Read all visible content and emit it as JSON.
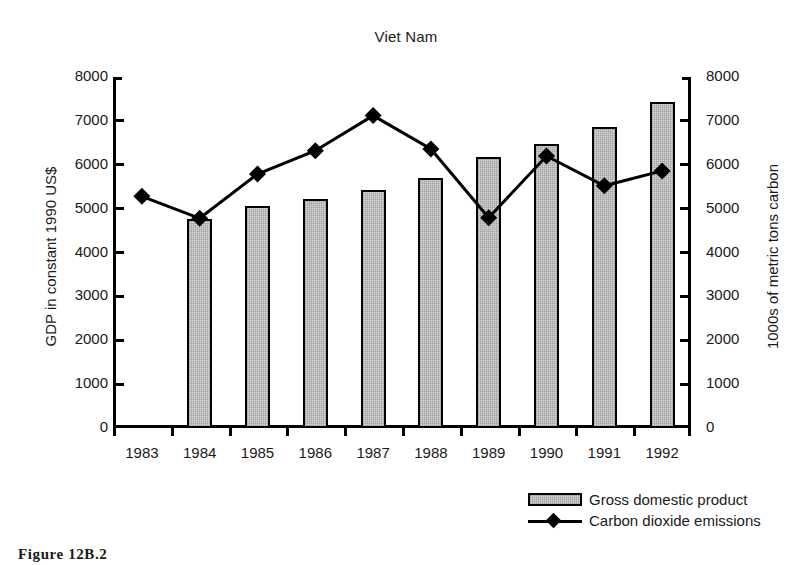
{
  "chart_data": {
    "type": "bar",
    "title": "Viet Nam",
    "xlabel": "",
    "ylabel": "GDP in constant 1990 US$",
    "ylabel_right": "1000s of metric tons carbon",
    "categories": [
      "1983",
      "1984",
      "1985",
      "1986",
      "1987",
      "1988",
      "1989",
      "1990",
      "1991",
      "1992"
    ],
    "ylim": [
      0,
      8000
    ],
    "ylim_right": [
      0,
      8000
    ],
    "yticks": [
      0,
      1000,
      2000,
      3000,
      4000,
      5000,
      6000,
      7000,
      8000
    ],
    "yticks_right": [
      0,
      1000,
      2000,
      3000,
      4000,
      5000,
      6000,
      7000,
      8000
    ],
    "grid": false,
    "legend_position": "bottom-right",
    "series": [
      {
        "name": "Gross domestic product",
        "type": "bar",
        "axis": "left",
        "values": [
          null,
          4760,
          5060,
          5220,
          5420,
          5700,
          6170,
          6470,
          6870,
          7430
        ]
      },
      {
        "name": "Carbon dioxide emissions",
        "type": "line",
        "axis": "right",
        "marker": "diamond",
        "values": [
          5280,
          4780,
          5790,
          6320,
          7120,
          6360,
          4790,
          6200,
          5520,
          5860
        ]
      }
    ],
    "ytick_labels": [
      "0",
      "1000",
      "2000",
      "3000",
      "4000",
      "5000",
      "6000",
      "7000",
      "8000"
    ],
    "ytick_labels_right": [
      "0",
      "1000",
      "2000",
      "3000",
      "4000",
      "5000",
      "6000",
      "7000",
      "8000"
    ]
  },
  "legend": {
    "items": [
      {
        "label": "Gross domestic product",
        "marker": "bar-swatch"
      },
      {
        "label": "Carbon dioxide emissions",
        "marker": "line-diamond"
      }
    ]
  },
  "caption": {
    "text": "Figure 12B.2"
  },
  "colors": {
    "bar_fill": "#d8d8d8",
    "bar_stroke": "#000000",
    "line": "#000000",
    "text": "#1a1a1a",
    "background": "#ffffff"
  }
}
